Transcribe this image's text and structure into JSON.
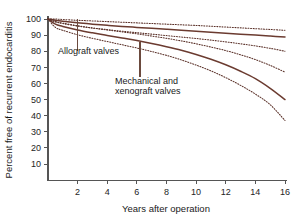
{
  "chart_data": {
    "type": "line",
    "title": "",
    "xlabel": "Years after operation",
    "ylabel": "Percent free of recurrent endocarditis",
    "xlim": [
      0,
      16
    ],
    "ylim": [
      0,
      100
    ],
    "xticks": [
      2,
      4,
      6,
      8,
      10,
      12,
      14,
      16
    ],
    "yticks": [
      10,
      20,
      30,
      40,
      50,
      60,
      70,
      80,
      90,
      100
    ],
    "grid": false,
    "legend_position": "none",
    "x": [
      0,
      0.5,
      1,
      2,
      3,
      4,
      5,
      6,
      7,
      8,
      9,
      10,
      11,
      12,
      13,
      14,
      15,
      16
    ],
    "series": [
      {
        "name": "Allograft valves",
        "style": "solid",
        "color": "#6b3b30",
        "values": [
          100,
          99.2,
          98.6,
          97.6,
          96.8,
          96.1,
          95.4,
          94.8,
          94.2,
          93.6,
          93.0,
          92.4,
          91.8,
          91.2,
          90.6,
          90.0,
          89.4,
          88.8
        ]
      },
      {
        "name": "Allograft valves upper 95% confidence limit",
        "style": "dotted",
        "color": "#5a3028",
        "values": [
          100,
          100,
          99.7,
          99.2,
          98.8,
          98.4,
          98.0,
          97.6,
          97.2,
          96.8,
          96.4,
          96.0,
          95.5,
          95.0,
          94.5,
          94.0,
          93.5,
          93.0
        ]
      },
      {
        "name": "Allograft valves lower 95% confidence limit",
        "style": "dotted",
        "color": "#5a3028",
        "values": [
          100,
          98.2,
          97.2,
          95.6,
          94.4,
          93.4,
          92.4,
          91.5,
          90.6,
          89.7,
          88.8,
          87.9,
          86.9,
          85.8,
          84.6,
          83.3,
          81.8,
          80.0
        ]
      },
      {
        "name": "Mechanical and xenograft valves",
        "style": "solid",
        "color": "#6b3b30",
        "values": [
          100,
          96.8,
          95.4,
          93.2,
          91.4,
          89.8,
          88.2,
          86.6,
          84.8,
          82.8,
          80.6,
          78.0,
          75.0,
          71.6,
          67.6,
          63.0,
          57.0,
          50.0
        ]
      },
      {
        "name": "Mechanical and xenograft valves upper 95% confidence limit",
        "style": "dotted",
        "color": "#5a3028",
        "values": [
          100,
          98.4,
          97.4,
          95.8,
          94.4,
          93.2,
          92.0,
          90.8,
          89.4,
          88.0,
          86.4,
          84.6,
          82.6,
          80.4,
          77.8,
          74.8,
          71.2,
          67.0
        ]
      },
      {
        "name": "Mechanical and xenograft valves lower 95% confidence limit",
        "style": "dotted",
        "color": "#5a3028",
        "values": [
          100,
          94.8,
          93.0,
          90.2,
          88.0,
          86.0,
          84.0,
          82.0,
          79.8,
          77.4,
          74.6,
          71.4,
          67.8,
          63.6,
          58.8,
          53.4,
          46.8,
          37.0
        ]
      }
    ],
    "annotations": [
      {
        "id": "allograft",
        "text": "Allograft valves",
        "text_x": 2.0,
        "text_y": 72,
        "leader_from_x": 2.0,
        "leader_from_y": 100,
        "leader_to_x": 2.0,
        "leader_to_y": 80
      },
      {
        "id": "mechanical",
        "line1": "Mechanical and",
        "line2": "xenograft valves",
        "text_x": 6.2,
        "text_y": 55,
        "leader_from_x": 6.2,
        "leader_from_y": 86,
        "leader_to_x": 6.2,
        "leader_to_y": 64
      }
    ]
  },
  "axis": {
    "ylabel": "Percent free of recurrent endocarditis",
    "xlabel": "Years after operation",
    "ytick_labels": [
      "100",
      "90",
      "80",
      "70",
      "60",
      "50",
      "40",
      "30",
      "20",
      "10"
    ],
    "xtick_labels": [
      "2",
      "4",
      "6",
      "8",
      "10",
      "12",
      "14",
      "16"
    ]
  },
  "annotation_labels": {
    "allograft": "Allograft valves",
    "mechanical_line1": "Mechanical and",
    "mechanical_line2": "xenograft valves"
  },
  "colors": {
    "curve_solid": "#6b3b30",
    "curve_dotted": "#5a3028",
    "axis": "#555555",
    "text": "#1a1a1a",
    "background": "#ffffff"
  }
}
